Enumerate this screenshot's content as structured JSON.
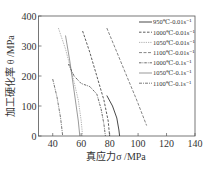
{
  "chart_data": {
    "type": "line",
    "title": "",
    "xlabel": "真应力σ /MPa",
    "ylabel": "加工硬化率 θ /MPa",
    "xlim": [
      30,
      140
    ],
    "ylim": [
      0,
      400
    ],
    "xticks": [
      40,
      60,
      80,
      100,
      120,
      140
    ],
    "yticks": [
      0,
      100,
      200,
      300,
      400
    ],
    "grid": false,
    "legend_position": "upper right",
    "series": [
      {
        "name": "950℃-0.01s⁻¹",
        "style": "solid",
        "x": [
          78,
          82,
          85,
          86.5,
          87
        ],
        "y": [
          135,
          100,
          60,
          20,
          0
        ]
      },
      {
        "name": "1000℃-0.01s⁻¹",
        "style": "dashed",
        "x": [
          61,
          66,
          71,
          76,
          79,
          80
        ],
        "y": [
          350,
          280,
          200,
          120,
          50,
          0
        ]
      },
      {
        "name": "1050℃-0.01s⁻¹",
        "style": "dotted",
        "x": [
          44,
          49,
          54,
          58,
          60,
          61
        ],
        "y": [
          360,
          290,
          200,
          120,
          50,
          0
        ]
      },
      {
        "name": "1100℃-0.01s⁻¹",
        "style": "dash",
        "x": [
          78,
          85,
          92,
          99,
          106
        ],
        "y": [
          360,
          280,
          200,
          120,
          35
        ]
      },
      {
        "name": "1000℃-0.1s⁻¹",
        "style": "dashdot",
        "x": [
          51,
          55,
          60,
          66,
          71,
          74,
          76,
          77
        ],
        "y": [
          240,
          200,
          175,
          165,
          140,
          90,
          40,
          0
        ]
      },
      {
        "name": "1050℃-0.1s⁻¹",
        "style": "thin-solid",
        "x": [
          49,
          52,
          55,
          58,
          59
        ],
        "y": [
          335,
          250,
          150,
          50,
          0
        ]
      },
      {
        "name": "1100℃-0.1s⁻¹",
        "style": "dashdot2",
        "x": [
          40,
          43,
          45.5,
          47
        ],
        "y": [
          190,
          130,
          60,
          0
        ]
      }
    ]
  }
}
